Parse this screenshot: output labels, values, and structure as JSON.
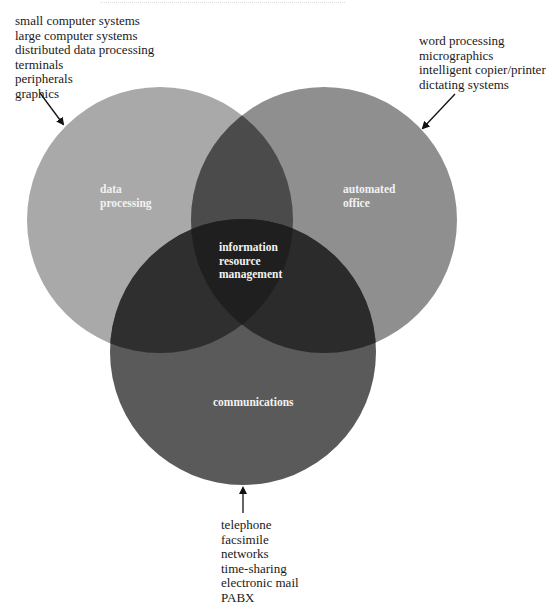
{
  "diagram": {
    "type": "venn",
    "circles": [
      {
        "id": "data-processing",
        "label_lines": [
          "data",
          "processing"
        ],
        "color": "#a9a9a9"
      },
      {
        "id": "automated-office",
        "label_lines": [
          "automated",
          "office"
        ],
        "color": "#8f8f8f"
      },
      {
        "id": "communications",
        "label_lines": [
          "communications"
        ],
        "color": "#5a5a5a"
      }
    ],
    "center": {
      "label_lines": [
        "information",
        "resource",
        "management"
      ]
    },
    "colors": {
      "dp_ao": "#4b4b4b",
      "dp_cm": "#2f2f2f",
      "ao_cm": "#2b2b2b",
      "center": "#1f1f1f",
      "label_text": "#f2f2f2",
      "arrow": "#111111"
    }
  },
  "lists": {
    "data_processing": [
      "small computer systems",
      "large computer systems",
      "distributed data processing",
      "terminals",
      "peripherals",
      "graphics"
    ],
    "automated_office": [
      "word processing",
      "micrographics",
      "intelligent copier/printer",
      "dictating systems"
    ],
    "communications": [
      "telephone",
      "facsimile",
      "networks",
      "time-sharing",
      "electronic mail",
      "PABX"
    ]
  }
}
